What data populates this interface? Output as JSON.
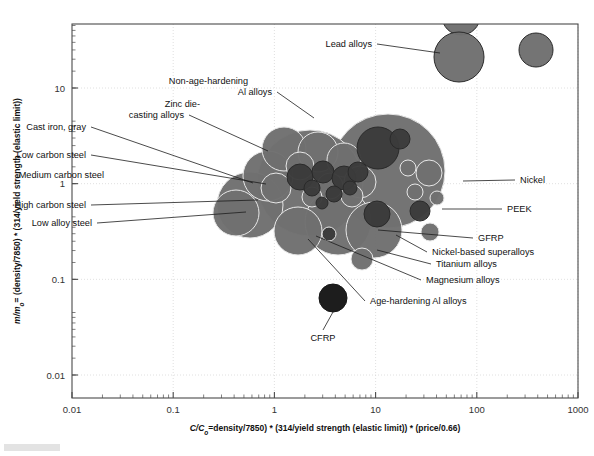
{
  "chart_data": {
    "type": "scatter",
    "title": "",
    "xlabel": "C/Co = density/7850) * (314/yield strength (elastic limit)) * (price/0.66)",
    "ylabel": "m/mo = (density/7850) * (314/yield strength (elastic limit))",
    "xlabel_parts": {
      "lead_italic": "C/C",
      "lead_sub": "o",
      "rest": "=density/7850) * (314/yield strength (elastic limit)) * (price/0.66)"
    },
    "ylabel_parts": {
      "lead_italic": "m/m",
      "lead_sub": "o",
      "rest": "= (density/7850) * (314/yield strength (elastic limit))"
    },
    "xscale": "log",
    "yscale": "log",
    "xlim": [
      0.01,
      1000
    ],
    "ylim": [
      0.005,
      50
    ],
    "xticks": [
      "0.01",
      "0.1",
      "1",
      "10",
      "100",
      "1000"
    ],
    "xtick_values": [
      0.01,
      0.1,
      1,
      10,
      100,
      1000
    ],
    "yticks": [
      "10",
      "1",
      "0.1",
      "0.01"
    ],
    "ytick_values": [
      10,
      1,
      0.1,
      0.01
    ],
    "grid": true,
    "legend_position": "none",
    "colors": {
      "bubble_mid": "#6f6f6f",
      "bubble_dark": "#3b3b3b",
      "bubble_black": "#161616",
      "bubble_stroke_light": "#e8e8e8",
      "bubble_stroke_dark": "#2a2a2a",
      "frame": "#4a4a4a",
      "grid": "#d8d8d8",
      "text": "#111111"
    },
    "annotations": [
      {
        "label": "Lead alloys",
        "side": "left",
        "tx": 372,
        "ty": 47,
        "ex": 440,
        "ey": 53
      },
      {
        "label": "Non-age-hardening",
        "side": "left",
        "tx": 248,
        "ty": 84,
        "ex": 314,
        "ey": 118
      },
      {
        "label": "Al alloys",
        "side": "left",
        "tx": 272,
        "ty": 95,
        "ex": 314,
        "ey": 118
      },
      {
        "label": "Zinc die-",
        "side": "left",
        "tx": 200,
        "ty": 107,
        "ex": 268,
        "ey": 151
      },
      {
        "label": "casting alloys",
        "side": "left",
        "tx": 184,
        "ty": 118,
        "ex": 268,
        "ey": 151
      },
      {
        "label": "Cast iron, gray",
        "side": "left",
        "tx": 86,
        "ty": 130,
        "ex": 253,
        "ey": 183
      },
      {
        "label": "Low carbon steel",
        "side": "left",
        "tx": 86,
        "ty": 158,
        "ex": 266,
        "ey": 184
      },
      {
        "label": "Medium carbon steel",
        "side": "left",
        "tx": 104,
        "ty": 178,
        "ex": 265,
        "ey": 192
      },
      {
        "label": "High carbon steel",
        "side": "left",
        "tx": 86,
        "ty": 208,
        "ex": 258,
        "ey": 200
      },
      {
        "label": "Low alloy steel",
        "side": "left",
        "tx": 92,
        "ty": 226,
        "ex": 246,
        "ey": 212
      },
      {
        "label": "Nickel",
        "side": "right",
        "tx": 520,
        "ty": 183,
        "ex": 463,
        "ey": 181
      },
      {
        "label": "PEEK",
        "side": "right",
        "tx": 507,
        "ty": 212,
        "ex": 442,
        "ey": 209
      },
      {
        "label": "GFRP",
        "side": "right",
        "tx": 478,
        "ty": 241,
        "ex": 378,
        "ey": 230
      },
      {
        "label": "Nickel-based superalloys",
        "side": "right",
        "tx": 432,
        "ty": 255,
        "ex": 396,
        "ey": 235
      },
      {
        "label": "Titanium alloys",
        "side": "right",
        "tx": 436,
        "ty": 267,
        "ex": 377,
        "ey": 250
      },
      {
        "label": "Magnesium alloys",
        "side": "right",
        "tx": 426,
        "ty": 283,
        "ex": 316,
        "ey": 236
      },
      {
        "label": "Age-hardening Al alloys",
        "side": "right",
        "tx": 370,
        "ty": 304,
        "ex": 308,
        "ey": 239
      },
      {
        "label": "CFRP",
        "side": "below",
        "tx": 323,
        "ty": 341,
        "ex": 333,
        "ey": 312
      }
    ],
    "bubbles": [
      {
        "name": "lead-alloys-top-clip",
        "cx": 461,
        "cy": 16,
        "r": 19,
        "fill": "#6f6f6f",
        "stroke": "#2a2a2a"
      },
      {
        "name": "lead-alloys-main",
        "cx": 459,
        "cy": 57,
        "r": 25,
        "fill": "#6f6f6f",
        "stroke": "#2a2a2a"
      },
      {
        "name": "lead-alloys-right",
        "cx": 536,
        "cy": 50,
        "r": 17,
        "fill": "#6f6f6f",
        "stroke": "#2a2a2a"
      },
      {
        "name": "nickel-superalloy-big",
        "cx": 388,
        "cy": 171,
        "r": 57,
        "fill": "#6f6f6f",
        "stroke": "#e8e8e8"
      },
      {
        "name": "al-alloys-big",
        "cx": 310,
        "cy": 183,
        "r": 53,
        "fill": "#6f6f6f",
        "stroke": "#e8e8e8"
      },
      {
        "name": "steel-big-left",
        "cx": 250,
        "cy": 205,
        "r": 33,
        "fill": "#6f6f6f",
        "stroke": "#e8e8e8"
      },
      {
        "name": "cast-iron-cluster",
        "cx": 268,
        "cy": 176,
        "r": 25,
        "fill": "#6f6f6f",
        "stroke": "#e8e8e8"
      },
      {
        "name": "low-alloy-steel",
        "cx": 236,
        "cy": 213,
        "r": 23,
        "fill": "#6f6f6f",
        "stroke": "#e8e8e8"
      },
      {
        "name": "medium-carbon-steel",
        "cx": 276,
        "cy": 188,
        "r": 15,
        "fill": "#6f6f6f",
        "stroke": "#e8e8e8"
      },
      {
        "name": "titanium-alloys",
        "cx": 338,
        "cy": 222,
        "r": 33,
        "fill": "#6f6f6f",
        "stroke": "#e8e8e8"
      },
      {
        "name": "gfrp-bubble",
        "cx": 374,
        "cy": 230,
        "r": 28,
        "fill": "#6f6f6f",
        "stroke": "#e8e8e8"
      },
      {
        "name": "magnesium-alloys",
        "cx": 298,
        "cy": 231,
        "r": 24,
        "fill": "#6f6f6f",
        "stroke": "#e8e8e8"
      },
      {
        "name": "zinc-die-casting",
        "cx": 284,
        "cy": 149,
        "r": 22,
        "fill": "#6f6f6f",
        "stroke": "#e8e8e8"
      },
      {
        "name": "mid-cluster-a",
        "cx": 318,
        "cy": 152,
        "r": 20,
        "fill": "#6f6f6f",
        "stroke": "#e8e8e8"
      },
      {
        "name": "mid-cluster-b",
        "cx": 344,
        "cy": 160,
        "r": 17,
        "fill": "#6f6f6f",
        "stroke": "#e8e8e8"
      },
      {
        "name": "mid-cluster-c",
        "cx": 300,
        "cy": 166,
        "r": 14,
        "fill": "#6f6f6f",
        "stroke": "#e8e8e8"
      },
      {
        "name": "mid-cluster-d",
        "cx": 360,
        "cy": 182,
        "r": 16,
        "fill": "#6f6f6f",
        "stroke": "#e8e8e8"
      },
      {
        "name": "mid-cluster-e",
        "cx": 330,
        "cy": 186,
        "r": 13,
        "fill": "#6f6f6f",
        "stroke": "#e8e8e8"
      },
      {
        "name": "mid-cluster-f",
        "cx": 352,
        "cy": 196,
        "r": 11,
        "fill": "#6f6f6f",
        "stroke": "#e8e8e8"
      },
      {
        "name": "mid-cluster-g",
        "cx": 312,
        "cy": 197,
        "r": 10,
        "fill": "#6f6f6f",
        "stroke": "#e8e8e8"
      },
      {
        "name": "nickel-small",
        "cx": 429,
        "cy": 173,
        "r": 13,
        "fill": "#6f6f6f",
        "stroke": "#e8e8e8"
      },
      {
        "name": "nickel-small-2",
        "cx": 408,
        "cy": 168,
        "r": 8,
        "fill": "#6f6f6f",
        "stroke": "#e8e8e8"
      },
      {
        "name": "nickel-small-3",
        "cx": 415,
        "cy": 192,
        "r": 8,
        "fill": "#6f6f6f",
        "stroke": "#e8e8e8"
      },
      {
        "name": "right-small-a",
        "cx": 437,
        "cy": 198,
        "r": 7,
        "fill": "#6f6f6f",
        "stroke": "#e8e8e8"
      },
      {
        "name": "lower-small-a",
        "cx": 362,
        "cy": 259,
        "r": 11,
        "fill": "#6f6f6f",
        "stroke": "#e8e8e8"
      },
      {
        "name": "lower-small-b",
        "cx": 430,
        "cy": 232,
        "r": 9,
        "fill": "#6f6f6f",
        "stroke": "#e8e8e8"
      },
      {
        "name": "dark-cluster-1",
        "cx": 378,
        "cy": 148,
        "r": 21,
        "fill": "#3b3b3b",
        "stroke": "#2a2a2a"
      },
      {
        "name": "dark-cluster-2",
        "cx": 400,
        "cy": 139,
        "r": 10,
        "fill": "#3b3b3b",
        "stroke": "#2a2a2a"
      },
      {
        "name": "dark-cluster-3",
        "cx": 300,
        "cy": 177,
        "r": 13,
        "fill": "#3b3b3b",
        "stroke": "#2a2a2a"
      },
      {
        "name": "dark-cluster-4",
        "cx": 323,
        "cy": 172,
        "r": 11,
        "fill": "#3b3b3b",
        "stroke": "#2a2a2a"
      },
      {
        "name": "dark-cluster-5",
        "cx": 344,
        "cy": 178,
        "r": 12,
        "fill": "#3b3b3b",
        "stroke": "#2a2a2a"
      },
      {
        "name": "dark-cluster-6",
        "cx": 358,
        "cy": 172,
        "r": 10,
        "fill": "#3b3b3b",
        "stroke": "#2a2a2a"
      },
      {
        "name": "dark-cluster-7",
        "cx": 312,
        "cy": 188,
        "r": 8,
        "fill": "#3b3b3b",
        "stroke": "#2a2a2a"
      },
      {
        "name": "dark-cluster-8",
        "cx": 334,
        "cy": 194,
        "r": 8,
        "fill": "#3b3b3b",
        "stroke": "#2a2a2a"
      },
      {
        "name": "dark-cluster-9",
        "cx": 350,
        "cy": 188,
        "r": 7,
        "fill": "#3b3b3b",
        "stroke": "#2a2a2a"
      },
      {
        "name": "dark-cluster-10",
        "cx": 322,
        "cy": 203,
        "r": 6,
        "fill": "#3b3b3b",
        "stroke": "#2a2a2a"
      },
      {
        "name": "dark-peek",
        "cx": 420,
        "cy": 211,
        "r": 10,
        "fill": "#3b3b3b",
        "stroke": "#2a2a2a"
      },
      {
        "name": "dark-age-hard-al",
        "cx": 377,
        "cy": 214,
        "r": 13,
        "fill": "#3b3b3b",
        "stroke": "#2a2a2a"
      },
      {
        "name": "dark-small-ellipse",
        "cx": 329,
        "cy": 234,
        "r": 7,
        "fill": "#3b3b3b",
        "stroke": "#e8e8e8"
      },
      {
        "name": "cfrp",
        "cx": 333,
        "cy": 298,
        "r": 14,
        "fill": "#161616",
        "stroke": "#161616"
      }
    ]
  }
}
